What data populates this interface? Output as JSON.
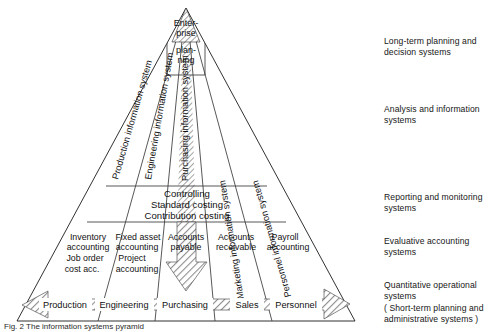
{
  "figure": {
    "caption": "Fig. 2 The information systems pyramid",
    "type": "pyramid-diagram"
  },
  "pyramid": {
    "apex_label_lines": [
      "Enter-",
      "prise",
      "plan-",
      "ning"
    ],
    "apex_label": "Enterprise planning",
    "columns": [
      "Production information system",
      "Engineering information system",
      "Purchasing  information system",
      "Marketing information system",
      "Personnel information system"
    ],
    "controlling_block_lines": [
      "Controlling",
      "Standard costing",
      "Contribution costing"
    ],
    "accounting_cells": [
      {
        "lines": [
          "Inventory",
          "accounting",
          "Job order",
          "cost acc."
        ]
      },
      {
        "lines": [
          "Fixed asset",
          "accounting",
          "Project",
          "accounting"
        ]
      },
      {
        "lines": [
          "Accounts",
          "payable"
        ]
      },
      {
        "lines": [
          "Accounts",
          "receivable"
        ]
      },
      {
        "lines": [
          "Payroll",
          "accounting"
        ]
      }
    ],
    "base_departments": [
      "Production",
      "Engineering",
      "Purchasing",
      "Sales",
      "Personnel"
    ],
    "highlight_column": "Purchasing  information system",
    "arrows": {
      "vertical_down": "downward-flow-arrow",
      "horizontal_double": "bidirectional-operational-arrow"
    }
  },
  "tier_notes": [
    {
      "lines": [
        "Long-term planning  and",
        "decision systems"
      ]
    },
    {
      "lines": [
        "Analysis and information",
        "systems"
      ]
    },
    {
      "lines": [
        "Reporting and monitoring",
        "systems"
      ]
    },
    {
      "lines": [
        "Evaluative accounting",
        "systems"
      ]
    },
    {
      "lines": [
        "Quantitative operational",
        "systems",
        "( Short-term planning and",
        "administrative systems )"
      ]
    }
  ],
  "colors": {
    "line": "#1a1a1a",
    "hatch": "#9a9a9a",
    "background": "#ffffff",
    "text": "#111111"
  }
}
